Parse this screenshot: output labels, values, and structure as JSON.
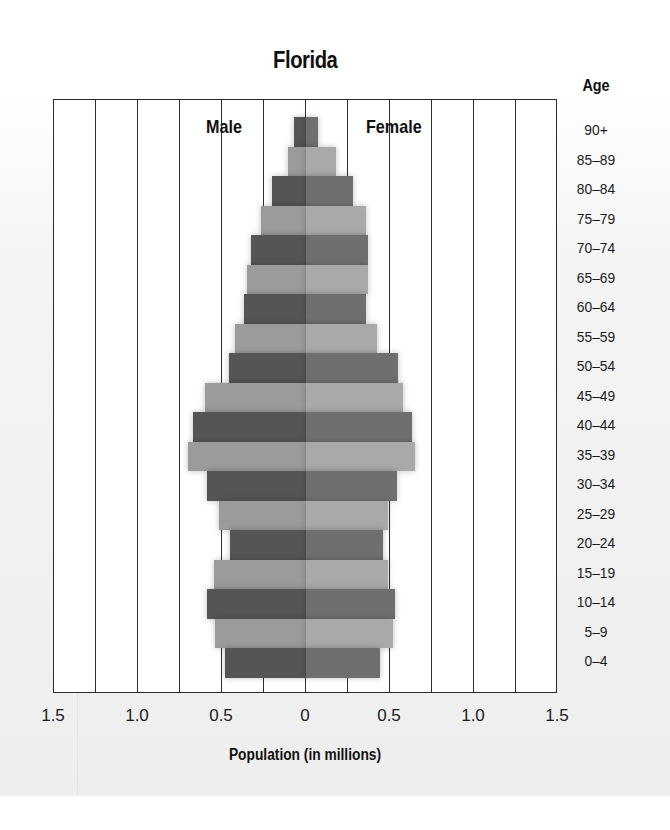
{
  "chart_data": {
    "type": "bar",
    "subtype": "population-pyramid",
    "title": "Florida",
    "xlabel": "Population (in millions)",
    "ylabel": "Age",
    "xlim": [
      -1.5,
      1.5
    ],
    "x_ticks": [
      -1.5,
      -1.0,
      -0.5,
      0,
      0.5,
      1.0,
      1.5
    ],
    "x_tick_labels": [
      "1.5",
      "1.0",
      "0.5",
      "0",
      "0.5",
      "1.0",
      "1.5"
    ],
    "grid": {
      "vertical": true,
      "interval": 0.25
    },
    "legend": {
      "left_label": "Male",
      "right_label": "Female"
    },
    "categories": [
      "90+",
      "85–89",
      "80–84",
      "75–79",
      "70–74",
      "65–69",
      "60–64",
      "55–59",
      "50–54",
      "45–49",
      "40–44",
      "35–39",
      "30–34",
      "25–29",
      "20–24",
      "15–19",
      "10–14",
      "5–9",
      "0–4"
    ],
    "series": [
      {
        "name": "Male",
        "values": [
          0.07,
          0.11,
          0.2,
          0.27,
          0.33,
          0.35,
          0.37,
          0.42,
          0.46,
          0.6,
          0.67,
          0.7,
          0.59,
          0.52,
          0.45,
          0.55,
          0.59,
          0.54,
          0.48
        ]
      },
      {
        "name": "Female",
        "values": [
          0.07,
          0.18,
          0.28,
          0.36,
          0.37,
          0.37,
          0.36,
          0.42,
          0.55,
          0.58,
          0.63,
          0.65,
          0.54,
          0.49,
          0.46,
          0.49,
          0.53,
          0.52,
          0.44
        ]
      }
    ],
    "colors": {
      "male_dark": "#555555",
      "male_light": "#9b9b9b",
      "female_dark": "#6f6f6f",
      "female_light": "#a9a9a9"
    }
  }
}
